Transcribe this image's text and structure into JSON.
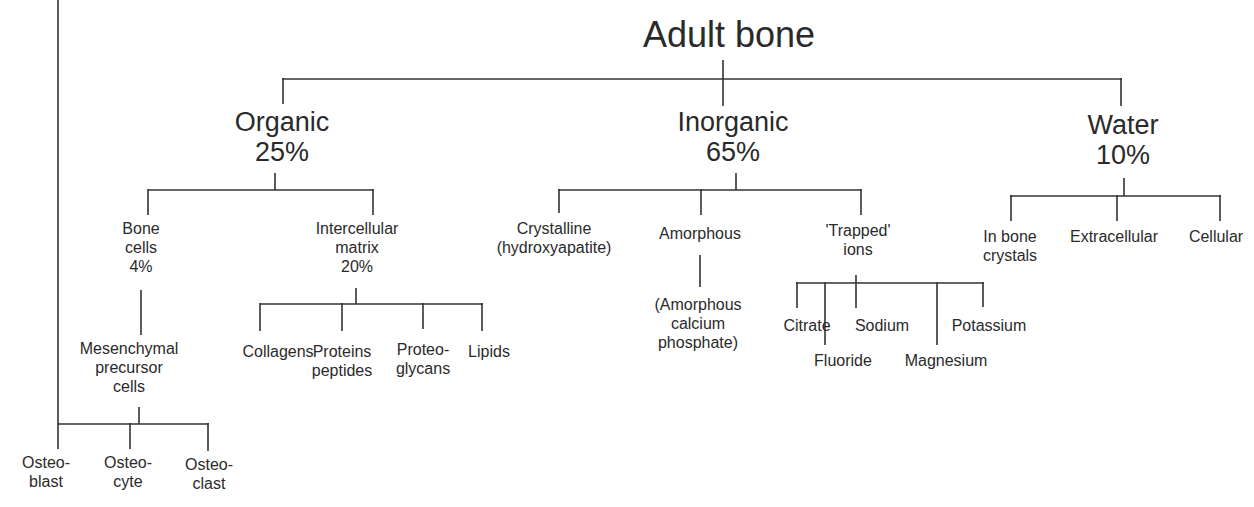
{
  "diagram": {
    "title": "Adult bone",
    "organic": {
      "label": "Organic",
      "percent": "25%",
      "bone_cells": {
        "line1": "Bone",
        "line2": "cells",
        "percent": "4%",
        "mesenchymal": {
          "line1": "Mesenchymal",
          "line2": "precursor",
          "line3": "cells",
          "children": [
            {
              "line1": "Osteo-",
              "line2": "blast"
            },
            {
              "line1": "Osteo-",
              "line2": "cyte"
            },
            {
              "line1": "Osteo-",
              "line2": "clast"
            }
          ]
        }
      },
      "matrix": {
        "line1": "Intercellular",
        "line2": "matrix",
        "percent": "20%",
        "children": [
          {
            "line1": "Collagens",
            "line2": ""
          },
          {
            "line1": "Proteins",
            "line2": "peptides"
          },
          {
            "line1": "Proteo-",
            "line2": "glycans"
          },
          {
            "line1": "Lipids",
            "line2": ""
          }
        ]
      }
    },
    "inorganic": {
      "label": "Inorganic",
      "percent": "65%",
      "crystalline": {
        "line1": "Crystalline",
        "line2": "(hydroxyapatite)"
      },
      "amorphous": {
        "label": "Amorphous",
        "child": {
          "line1": "(Amorphous",
          "line2": "calcium",
          "line3": "phosphate)"
        }
      },
      "trapped_ions": {
        "line1": "'Trapped'",
        "line2": "ions",
        "children": [
          "Citrate",
          "Fluoride",
          "Sodium",
          "Magnesium",
          "Potassium"
        ]
      }
    },
    "water": {
      "label": "Water",
      "percent": "10%",
      "children": [
        {
          "line1": "In bone",
          "line2": "crystals"
        },
        {
          "line1": "Extracellular",
          "line2": ""
        },
        {
          "line1": "Cellular",
          "line2": ""
        }
      ]
    }
  }
}
